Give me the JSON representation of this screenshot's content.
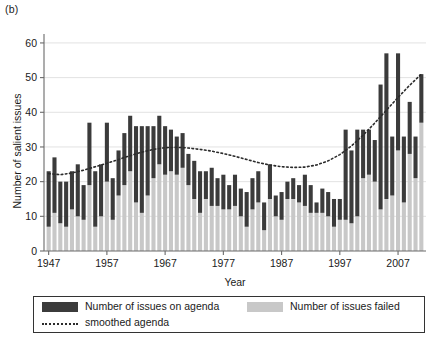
{
  "figure": {
    "panel_label": "(b)"
  },
  "legend": {
    "items": [
      {
        "key": "on_agenda",
        "label": "Number of issues on agenda",
        "swatch": "dark-square-swatch",
        "color": "#3b3b3b"
      },
      {
        "key": "failed",
        "label": "Number of issues failed",
        "swatch": "light-square-swatch",
        "color": "#c8c8c8"
      },
      {
        "key": "smoothed",
        "label": "smoothed agenda",
        "swatch": "dotted-line-swatch",
        "color": "#2b2b2b"
      }
    ]
  },
  "chart_data": {
    "type": "bar",
    "subtype": "stacked-bar-with-overlaid-line",
    "title": "",
    "xlabel": "Year",
    "ylabel": "Number of salient issues",
    "xlim": [
      1946.2,
      2011.8
    ],
    "ylim": [
      0,
      62
    ],
    "yticks": [
      0,
      10,
      20,
      30,
      40,
      50,
      60
    ],
    "xticks": [
      1947,
      1957,
      1967,
      1977,
      1987,
      1997,
      2007
    ],
    "grid": "horizontal-light",
    "legend_position": "below-plot",
    "x": [
      1947,
      1948,
      1949,
      1950,
      1951,
      1952,
      1953,
      1954,
      1955,
      1956,
      1957,
      1958,
      1959,
      1960,
      1961,
      1962,
      1963,
      1964,
      1965,
      1966,
      1967,
      1968,
      1969,
      1970,
      1971,
      1972,
      1973,
      1974,
      1975,
      1976,
      1977,
      1978,
      1979,
      1980,
      1981,
      1982,
      1983,
      1984,
      1985,
      1986,
      1987,
      1988,
      1989,
      1990,
      1991,
      1992,
      1993,
      1994,
      1995,
      1996,
      1997,
      1998,
      1999,
      2000,
      2001,
      2002,
      2003,
      2004,
      2005,
      2006,
      2007,
      2008,
      2009,
      2010,
      2011
    ],
    "series": [
      {
        "name": "Number of issues failed",
        "key": "failed",
        "color": "#c8c8c8",
        "stack": "bottom",
        "values": [
          7,
          11,
          8,
          7,
          12,
          10,
          9,
          19,
          7,
          10,
          20,
          9,
          16,
          19,
          23,
          14,
          11,
          16,
          21,
          25,
          22,
          23,
          22,
          24,
          19,
          15,
          11,
          15,
          13,
          13,
          12,
          12,
          13,
          10,
          7,
          12,
          14,
          6,
          15,
          10,
          9,
          15,
          15,
          14,
          13,
          11,
          11,
          11,
          10,
          7,
          9,
          9,
          8,
          10,
          21,
          22,
          20,
          12,
          15,
          16,
          29,
          14,
          28,
          21,
          37
        ]
      },
      {
        "name": "Number of issues on agenda",
        "key": "on_agenda",
        "color": "#3b3b3b",
        "stack": "top",
        "values": [
          16,
          16,
          12,
          13,
          11,
          15,
          10,
          18,
          16,
          15,
          17,
          12,
          13,
          15,
          16,
          22,
          25,
          20,
          15,
          14,
          14,
          12,
          11,
          10,
          9,
          11,
          12,
          8,
          11,
          8,
          10,
          7,
          9,
          8,
          10,
          9,
          9,
          8,
          10,
          6,
          8,
          5,
          6,
          5,
          9,
          8,
          3,
          7,
          7,
          8,
          6,
          26,
          21,
          25,
          14,
          13,
          12,
          36,
          42,
          17,
          28,
          19,
          15,
          12,
          14
        ]
      }
    ],
    "totals": [
      23,
      27,
      20,
      20,
      23,
      25,
      19,
      37,
      23,
      25,
      37,
      21,
      29,
      34,
      39,
      36,
      36,
      36,
      36,
      39,
      36,
      35,
      33,
      34,
      28,
      26,
      23,
      23,
      24,
      21,
      22,
      19,
      22,
      18,
      17,
      21,
      23,
      14,
      25,
      16,
      17,
      20,
      21,
      19,
      22,
      19,
      14,
      18,
      17,
      15,
      15,
      35,
      29,
      35,
      35,
      35,
      32,
      48,
      57,
      33,
      57,
      33,
      43,
      33,
      51
    ],
    "smoothed_agenda": {
      "name": "smoothed agenda",
      "style": "dotted",
      "color": "#2b2b2b",
      "x": [
        1947,
        1949,
        1951,
        1953,
        1955,
        1957,
        1959,
        1961,
        1963,
        1965,
        1967,
        1969,
        1971,
        1973,
        1975,
        1977,
        1979,
        1981,
        1983,
        1985,
        1987,
        1989,
        1991,
        1993,
        1995,
        1997,
        1999,
        2001,
        2003,
        2005,
        2007,
        2009,
        2011
      ],
      "values": [
        22.3,
        22.0,
        22.5,
        23.3,
        24.3,
        25.3,
        26.4,
        27.5,
        28.5,
        29.3,
        29.8,
        29.9,
        29.7,
        29.3,
        28.8,
        28.1,
        27.3,
        26.4,
        25.5,
        24.8,
        24.3,
        24.1,
        24.2,
        24.8,
        26.0,
        27.8,
        30.3,
        33.4,
        36.9,
        40.6,
        44.3,
        47.8,
        51.0
      ]
    }
  }
}
